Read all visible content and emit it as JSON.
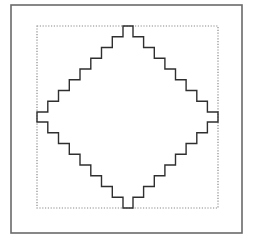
{
  "figure": {
    "width": 256,
    "height": 245,
    "background": "#ffffff"
  },
  "outer_frame": {
    "x": 11,
    "y": 5,
    "width": 231,
    "height": 228,
    "stroke": "#6a6a6a",
    "stroke_width": 1.6
  },
  "bounding_box": {
    "x": 37,
    "y": 26,
    "width": 181,
    "height": 182,
    "stroke": "#8a8a8a",
    "dash": "1.2 1.6",
    "stroke_width": 1.2
  },
  "stepped_diamond": {
    "stroke": "#2f2f2f",
    "stroke_width": 1.4,
    "steps_per_quadrant": 8,
    "top_flat": {
      "x1": 123,
      "x2": 133,
      "y": 26
    },
    "bottom_flat": {
      "x1": 123,
      "x2": 133,
      "y": 208
    },
    "left_flat": {
      "x": 37,
      "y1": 112,
      "y2": 122
    },
    "right_flat": {
      "x": 218,
      "y1": 112,
      "y2": 122
    }
  }
}
